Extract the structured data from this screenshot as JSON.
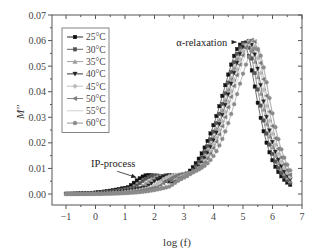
{
  "chart_data": {
    "type": "line",
    "title": "",
    "xlabel": "log (f)",
    "ylabel": "M''",
    "xlim": [
      -1.4,
      7
    ],
    "ylim": [
      -0.005,
      0.07
    ],
    "xticks": [
      -1,
      0,
      1,
      2,
      3,
      4,
      5,
      6,
      7
    ],
    "xtick_labels": [
      "-1",
      "0",
      "1",
      "2",
      "3",
      "4",
      "5",
      "6",
      "7"
    ],
    "yticks": [
      0.0,
      0.01,
      0.02,
      0.03,
      0.04,
      0.05,
      0.06,
      0.07
    ],
    "ytick_labels": [
      "0.00",
      "0.01",
      "0.02",
      "0.03",
      "0.04",
      "0.05",
      "0.06",
      "0.07"
    ],
    "grid": false,
    "legend_position": "upper left",
    "x_range_of_data": [
      -1.0,
      6.6
    ],
    "annotations": [
      {
        "text": "α-relaxation",
        "x_text": 3.6,
        "y_text": 0.0594,
        "arrow_to": [
          4.85,
          0.0594
        ]
      },
      {
        "text": "IP-process",
        "x_text": 0.6,
        "y_text": 0.012,
        "arrow_to": [
          1.45,
          0.0065
        ]
      }
    ],
    "series": [
      {
        "name": "25°C",
        "marker": "square",
        "color": "#111111",
        "alpha_peak_x": 5.0,
        "alpha_peak_y": 0.059,
        "ip_peak_x": 1.75,
        "ip_peak_y": 0.0062
      },
      {
        "name": "30°C",
        "marker": "square",
        "color": "#555555",
        "alpha_peak_x": 5.08,
        "alpha_peak_y": 0.0592,
        "ip_peak_x": 1.95,
        "ip_peak_y": 0.0058
      },
      {
        "name": "35°C",
        "marker": "triangle-up",
        "color": "#999999",
        "alpha_peak_x": 5.15,
        "alpha_peak_y": 0.0596,
        "ip_peak_x": 2.15,
        "ip_peak_y": 0.0054
      },
      {
        "name": "40°C",
        "marker": "triangle-down",
        "color": "#222222",
        "alpha_peak_x": 5.2,
        "alpha_peak_y": 0.0598,
        "ip_peak_x": 2.35,
        "ip_peak_y": 0.005
      },
      {
        "name": "45°C",
        "marker": "diamond",
        "color": "#bbbbbb",
        "alpha_peak_x": 5.27,
        "alpha_peak_y": 0.06,
        "ip_peak_x": 2.55,
        "ip_peak_y": 0.0046
      },
      {
        "name": "50°C",
        "marker": "triangle-left",
        "color": "#777777",
        "alpha_peak_x": 5.33,
        "alpha_peak_y": 0.0603,
        "ip_peak_x": 2.75,
        "ip_peak_y": 0.0042
      },
      {
        "name": "55°C",
        "marker": "none",
        "color": "#cccccc",
        "alpha_peak_x": 5.4,
        "alpha_peak_y": 0.0605,
        "ip_peak_x": 2.95,
        "ip_peak_y": 0.0038
      },
      {
        "name": "60°C",
        "marker": "circle",
        "color": "#8a8a8a",
        "alpha_peak_x": 5.45,
        "alpha_peak_y": 0.057,
        "ip_peak_x": 3.15,
        "ip_peak_y": 0.0034
      }
    ]
  },
  "legend": {
    "items": [
      "25°C",
      "30°C",
      "35°C",
      "40°C",
      "45°C",
      "50°C",
      "55°C",
      "60°C"
    ]
  },
  "labels": {
    "alpha": "α-relaxation",
    "ip": "IP-process",
    "xlabel": "log (f)",
    "ylabel": "M''"
  }
}
